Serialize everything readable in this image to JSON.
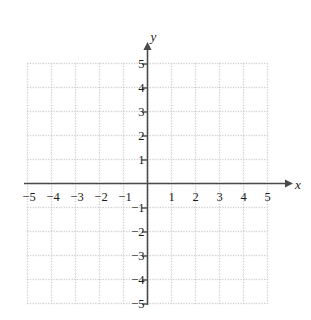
{
  "chart_data": {
    "type": "scatter",
    "title": "",
    "subtitle": "",
    "xlabel": "x",
    "ylabel": "y",
    "xlim": [
      -5,
      5
    ],
    "ylim": [
      -5,
      5
    ],
    "grid": true,
    "grid_style": "dotted",
    "grid_spacing": 1,
    "minor_ticks": true,
    "legend": null,
    "series": [],
    "values": [],
    "x": [],
    "annotations": [],
    "x_tick_labels": [
      "−5",
      "−4",
      "−3",
      "−2",
      "−1",
      "1",
      "2",
      "3",
      "4",
      "5"
    ],
    "x_tick_values": [
      -5,
      -4,
      -3,
      -2,
      -1,
      1,
      2,
      3,
      4,
      5
    ],
    "y_tick_labels": [
      "5",
      "4",
      "3",
      "2",
      "1",
      "−1",
      "−2",
      "−3",
      "−4",
      "−5"
    ],
    "y_tick_values": [
      5,
      4,
      3,
      2,
      1,
      -1,
      -2,
      -3,
      -4,
      -5
    ],
    "origin_label": "",
    "colors": {
      "grid": "#c9c9c9",
      "minor_grid": "#dcdcdc",
      "axis": "#4a4a4a",
      "text": "#1a1a1a",
      "background": "#ffffff"
    }
  },
  "axes": {
    "x_axis_label": "x",
    "y_axis_label": "y"
  },
  "x_ticks": [
    {
      "label": "−5",
      "value": -5
    },
    {
      "label": "−4",
      "value": -4
    },
    {
      "label": "−3",
      "value": -3
    },
    {
      "label": "−2",
      "value": -2
    },
    {
      "label": "−1",
      "value": -1
    },
    {
      "label": "1",
      "value": 1
    },
    {
      "label": "2",
      "value": 2
    },
    {
      "label": "3",
      "value": 3
    },
    {
      "label": "4",
      "value": 4
    },
    {
      "label": "5",
      "value": 5
    }
  ],
  "y_ticks": [
    {
      "label": "5",
      "value": 5
    },
    {
      "label": "4",
      "value": 4
    },
    {
      "label": "3",
      "value": 3
    },
    {
      "label": "2",
      "value": 2
    },
    {
      "label": "1",
      "value": 1
    },
    {
      "label": "−1",
      "value": -1
    },
    {
      "label": "−2",
      "value": -2
    },
    {
      "label": "−3",
      "value": -3
    },
    {
      "label": "−4",
      "value": -4
    },
    {
      "label": "−5",
      "value": -5
    }
  ]
}
